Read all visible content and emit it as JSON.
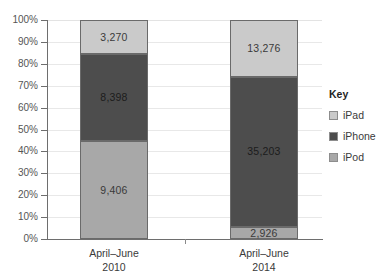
{
  "chart_data": {
    "type": "bar",
    "subtype": "stacked-100-percent",
    "title": "",
    "xlabel": "",
    "ylabel": "",
    "ylim": [
      0,
      100
    ],
    "ytick_labels": [
      "100%",
      "90%",
      "80%",
      "70%",
      "60%",
      "50%",
      "40%",
      "30%",
      "20%",
      "10%",
      "0%"
    ],
    "ytick_values": [
      100,
      90,
      80,
      70,
      60,
      50,
      40,
      30,
      20,
      10,
      0
    ],
    "grid": true,
    "legend_position": "right",
    "legend_title": "Key",
    "categories": [
      "April–June 2010",
      "April–June 2014"
    ],
    "category_lines": [
      {
        "top": "April–June",
        "bottom": "2010"
      },
      {
        "top": "April–June",
        "bottom": "2014"
      }
    ],
    "series": [
      {
        "name": "iPad",
        "color": "#cacaca",
        "values": [
          3270,
          13276
        ],
        "labels": [
          "3,270",
          "13,276"
        ],
        "percents": [
          15.5,
          25.8
        ]
      },
      {
        "name": "iPhone",
        "color": "#4d4d4d",
        "values": [
          8398,
          35203
        ],
        "labels": [
          "8,398",
          "35,203"
        ],
        "percents": [
          39.9,
          68.5
        ]
      },
      {
        "name": "iPod",
        "color": "#a8a8a8",
        "values": [
          9406,
          2926
        ],
        "labels": [
          "9,406",
          "2,926"
        ],
        "percents": [
          44.6,
          5.7
        ]
      }
    ],
    "totals": [
      21074,
      51405
    ],
    "stack_order_bottom_to_top": [
      "iPod",
      "iPhone",
      "iPad"
    ]
  },
  "legend": {
    "title": "Key",
    "items": [
      {
        "label": "iPad",
        "color": "#cacaca"
      },
      {
        "label": "iPhone",
        "color": "#4d4d4d"
      },
      {
        "label": "iPod",
        "color": "#a8a8a8"
      }
    ]
  },
  "axis": {
    "y_labels": [
      "100%",
      "90%",
      "80%",
      "70%",
      "60%",
      "50%",
      "40%",
      "30%",
      "20%",
      "10%",
      "0%"
    ]
  },
  "bars": [
    {
      "category_top": "April–June",
      "category_bottom": "2010",
      "segments": [
        {
          "name": "iPad",
          "label": "3,270",
          "percent": 15.52,
          "color": "#cacaca",
          "text_color": "#3a3a3a"
        },
        {
          "name": "iPhone",
          "label": "8,398",
          "percent": 39.85,
          "color": "#4d4d4d",
          "text_color": "#1c1c1c"
        },
        {
          "name": "iPod",
          "label": "9,406",
          "percent": 44.63,
          "color": "#a8a8a8",
          "text_color": "#3a3a3a"
        }
      ]
    },
    {
      "category_top": "April–June",
      "category_bottom": "2014",
      "segments": [
        {
          "name": "iPad",
          "label": "13,276",
          "percent": 25.83,
          "color": "#cacaca",
          "text_color": "#3a3a3a"
        },
        {
          "name": "iPhone",
          "label": "35,203",
          "percent": 68.48,
          "color": "#4d4d4d",
          "text_color": "#1c1c1c"
        },
        {
          "name": "iPod",
          "label": "2,926",
          "percent": 5.69,
          "color": "#a8a8a8",
          "text_color": "#3a3a3a"
        }
      ]
    }
  ]
}
